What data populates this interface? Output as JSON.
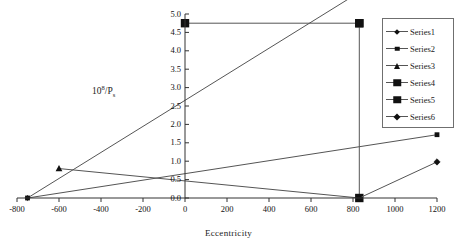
{
  "chart_data": {
    "type": "line",
    "title": "",
    "xlabel": "Eccentricity",
    "ylabel": "10^8/Ps",
    "ylabel_parts": {
      "base": "10",
      "exponent": "8",
      "divider": "/P",
      "subscript": "s"
    },
    "xlim": [
      -800,
      1200
    ],
    "ylim": [
      0.0,
      5.0
    ],
    "xticks": [
      -800,
      -600,
      -400,
      -200,
      0,
      200,
      400,
      600,
      800,
      1000,
      1200
    ],
    "xtick_labels": [
      "-800",
      "-600",
      "-400",
      "-200",
      "0",
      "200",
      "400",
      "600",
      "800",
      "1000",
      "1200"
    ],
    "yticks": [
      0.0,
      0.5,
      1.0,
      1.5,
      2.0,
      2.5,
      3.0,
      3.5,
      4.0,
      4.5,
      5.0
    ],
    "ytick_labels": [
      "0.0",
      "0.5",
      "1.0",
      "1.5",
      "2.0",
      "2.5",
      "3.0",
      "3.5",
      "4.0",
      "4.5",
      "5.0"
    ],
    "grid": false,
    "legend_position": "right",
    "line_color": "#555555",
    "marker_color": "#111111",
    "axis_color": "#333333",
    "series": [
      {
        "name": "Series1",
        "marker": "diamond-sm",
        "points": [
          [
            -750,
            0.0
          ],
          [
            1200,
            6.9
          ]
        ],
        "note": "steep rising line, exits top of plot near x=830"
      },
      {
        "name": "Series2",
        "marker": "square-sm",
        "points": [
          [
            -750,
            0.0
          ],
          [
            1200,
            1.72
          ]
        ]
      },
      {
        "name": "Series3",
        "marker": "triangle-sm",
        "points": [
          [
            -600,
            0.8
          ],
          [
            830,
            0.0
          ]
        ]
      },
      {
        "name": "Series4",
        "marker": "square-lg",
        "points": [
          [
            0,
            4.75
          ],
          [
            830,
            4.75
          ]
        ]
      },
      {
        "name": "Series5",
        "marker": "square-lg",
        "points": [
          [
            830,
            4.75
          ],
          [
            830,
            0.0
          ]
        ]
      },
      {
        "name": "Series6",
        "marker": "diamond-md",
        "points": [
          [
            830,
            0.0
          ],
          [
            1200,
            0.98
          ]
        ]
      }
    ]
  },
  "legend": {
    "entries": [
      {
        "label": "Series1",
        "marker": "diamond-sm"
      },
      {
        "label": "Series2",
        "marker": "square-sm"
      },
      {
        "label": "Series3",
        "marker": "triangle-sm"
      },
      {
        "label": "Series4",
        "marker": "square-lg"
      },
      {
        "label": "Series5",
        "marker": "square-lg"
      },
      {
        "label": "Series6",
        "marker": "diamond-md"
      }
    ]
  }
}
